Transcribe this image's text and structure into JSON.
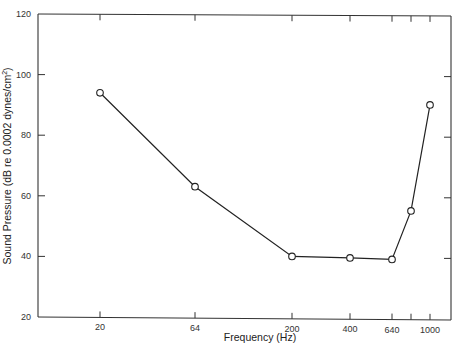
{
  "chart_data": {
    "type": "line",
    "title": "",
    "xlabel": "Frequency (Hz)",
    "ylabel": "Sound Pressure (dB re 0.0002 dynes/cm²)",
    "ylabel_main": "Sound Pressure (dB re 0.0002 dynes/cm",
    "ylabel_sup": "2",
    "ylabel_close": ")",
    "x_scale": "log",
    "x_ticks": [
      {
        "value": 20,
        "label": "20"
      },
      {
        "value": 64,
        "label": "64"
      },
      {
        "value": 200,
        "label": "200"
      },
      {
        "value": 400,
        "label": "400"
      },
      {
        "value": 640,
        "label": "640"
      },
      {
        "value": 800,
        "label": ""
      },
      {
        "value": 1000,
        "label": "1000"
      }
    ],
    "y_ticks": [
      20,
      40,
      60,
      80,
      100,
      120
    ],
    "ylim": [
      20,
      120
    ],
    "grid": false,
    "legend": null,
    "series": [
      {
        "name": "threshold",
        "marker": "open-circle",
        "x": [
          20,
          64,
          200,
          400,
          640,
          800,
          1000
        ],
        "values": [
          94,
          63,
          40,
          39.5,
          39,
          55,
          90
        ]
      }
    ]
  }
}
